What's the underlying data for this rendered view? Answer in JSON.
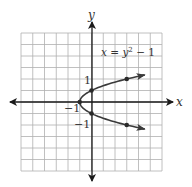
{
  "chart_data": {
    "type": "line",
    "title": "",
    "equation": "x = y² − 1",
    "xlabel": "x",
    "ylabel": "y",
    "xlim": [
      -6,
      6
    ],
    "ylim": [
      -6,
      6
    ],
    "grid": true,
    "grid_step": 1,
    "series": [
      {
        "name": "x = y^2 - 1",
        "points": [
          {
            "x": 3,
            "y": 2
          },
          {
            "x": 0,
            "y": 1
          },
          {
            "x": -1,
            "y": 0
          },
          {
            "x": 0,
            "y": -1
          },
          {
            "x": 3,
            "y": -2
          }
        ],
        "arrows": "both ends"
      }
    ],
    "annotations": [
      {
        "text": "1",
        "at": {
          "x": 0,
          "y": 1
        }
      },
      {
        "text": "−1",
        "at": {
          "x": -1,
          "y": 0
        }
      },
      {
        "text": "−1",
        "at": {
          "x": 0,
          "y": -1
        }
      }
    ]
  },
  "labels": {
    "x_axis": "x",
    "y_axis": "y",
    "eq_lhs": "x = y",
    "eq_exp": "2",
    "eq_rhs": " − 1",
    "tick_y_pos": "1",
    "tick_vertex": "−1",
    "tick_y_neg": "−1"
  },
  "colors": {
    "grid": "#b0b0b0",
    "axis": "#1a1a1a",
    "curve": "#3a3a3a",
    "text": "#333333"
  }
}
